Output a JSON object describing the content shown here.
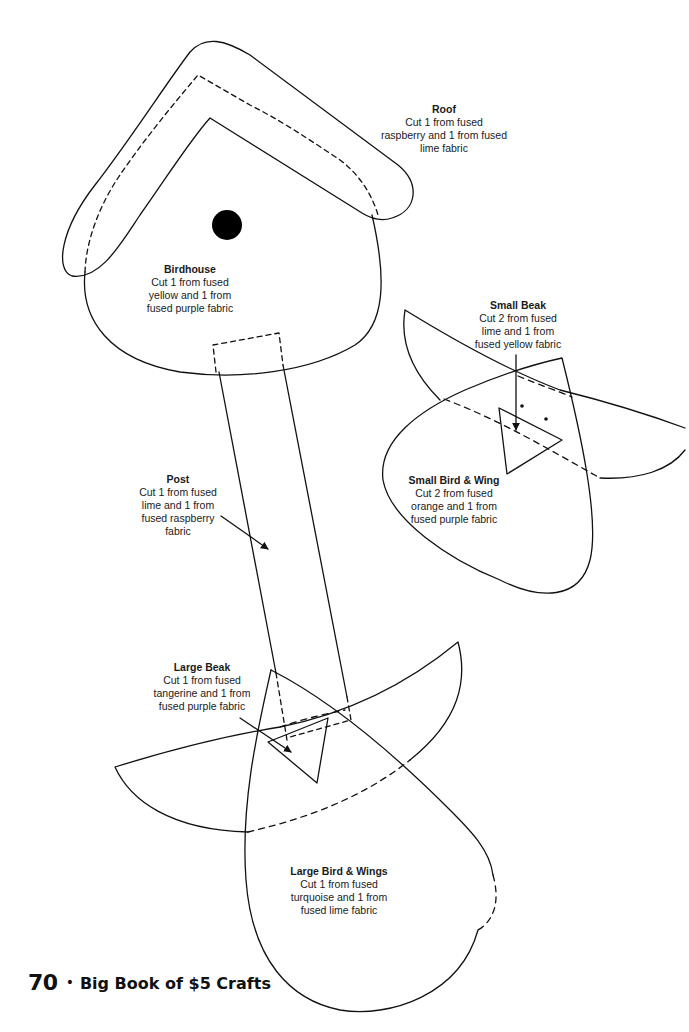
{
  "pattern_pieces": {
    "roof": {
      "title": "Roof",
      "lines": [
        "Cut 1 from fused",
        "raspberry and 1 from fused",
        "lime fabric"
      ]
    },
    "birdhouse": {
      "title": "Birdhouse",
      "lines": [
        "Cut 1 from fused",
        "yellow and 1 from",
        "fused purple fabric"
      ]
    },
    "small_beak": {
      "title": "Small Beak",
      "lines": [
        "Cut 2 from fused",
        "lime and 1 from",
        "fused yellow fabric"
      ]
    },
    "small_bird_wing": {
      "title": "Small Bird & Wing",
      "lines": [
        "Cut 2 from fused",
        "orange and 1 from",
        "fused purple fabric"
      ]
    },
    "post": {
      "title": "Post",
      "lines": [
        "Cut 1 from fused",
        "lime and 1 from",
        "fused raspberry",
        "fabric"
      ]
    },
    "large_beak": {
      "title": "Large Beak",
      "lines": [
        "Cut 1 from fused",
        "tangerine and 1 from",
        "fused purple fabric"
      ]
    },
    "large_bird_wings": {
      "title": "Large Bird & Wings",
      "lines": [
        "Cut 1 from fused",
        "turquoise and 1 from",
        "fused lime fabric"
      ]
    }
  },
  "footer": {
    "page_number": "70",
    "separator": "•",
    "book_title": "Big Book of $5 Crafts"
  },
  "colors": {
    "line": "#111111",
    "background": "#ffffff"
  }
}
